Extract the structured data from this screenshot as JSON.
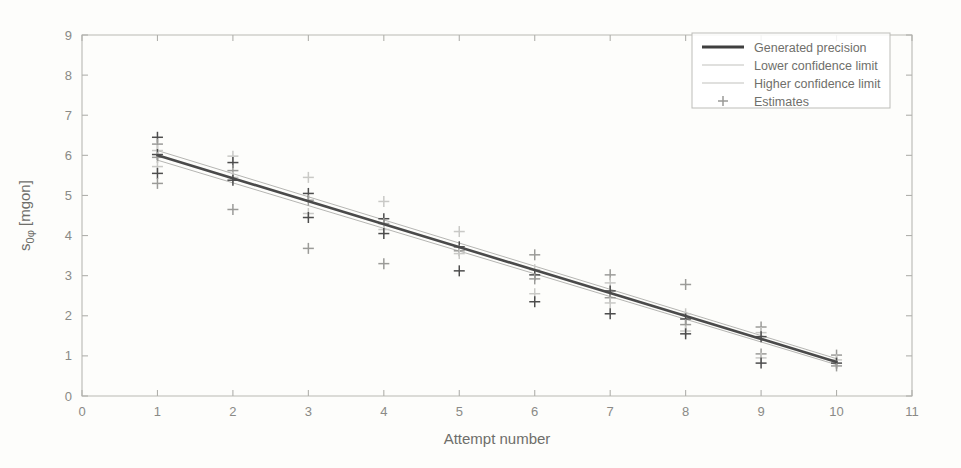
{
  "chart_data": {
    "type": "scatter",
    "title": "",
    "xlabel": "Attempt number",
    "ylabel": "s0φ [mgon]",
    "xlim": [
      0,
      11
    ],
    "ylim": [
      0,
      9
    ],
    "xticks": [
      0,
      1,
      2,
      3,
      4,
      5,
      6,
      7,
      8,
      9,
      10,
      11
    ],
    "yticks": [
      0,
      1,
      2,
      3,
      4,
      5,
      6,
      7,
      8,
      9
    ],
    "grid": false,
    "legend_position": "top-right",
    "legend": [
      {
        "label": "Generated precision",
        "style": "line",
        "color": "#3f3f3f"
      },
      {
        "label": "Lower confidence limit",
        "style": "line",
        "color": "#c6c6c3"
      },
      {
        "label": "Higher confidence limit",
        "style": "line",
        "color": "#c6c6c3"
      },
      {
        "label": "Estimates",
        "style": "plus-marker",
        "color": "#9a9a97"
      }
    ],
    "series": [
      {
        "name": "Generated precision",
        "type": "line",
        "x": [
          1,
          10
        ],
        "values": [
          6.0,
          0.85
        ]
      },
      {
        "name": "Lower confidence limit",
        "type": "line",
        "x": [
          1,
          10
        ],
        "values": [
          5.88,
          0.78
        ]
      },
      {
        "name": "Higher confidence limit",
        "type": "line",
        "x": [
          1,
          10
        ],
        "values": [
          6.12,
          0.93
        ]
      },
      {
        "name": "Estimates",
        "type": "scatter",
        "points": [
          {
            "x": 1,
            "y": 6.45
          },
          {
            "x": 1,
            "y": 6.28
          },
          {
            "x": 1,
            "y": 6.12
          },
          {
            "x": 1,
            "y": 6.02
          },
          {
            "x": 1,
            "y": 5.95
          },
          {
            "x": 1,
            "y": 5.72
          },
          {
            "x": 1,
            "y": 5.55
          },
          {
            "x": 1,
            "y": 5.3
          },
          {
            "x": 2,
            "y": 5.98
          },
          {
            "x": 2,
            "y": 5.82
          },
          {
            "x": 2,
            "y": 5.62
          },
          {
            "x": 2,
            "y": 5.45
          },
          {
            "x": 2,
            "y": 5.38
          },
          {
            "x": 2,
            "y": 4.65
          },
          {
            "x": 3,
            "y": 5.45
          },
          {
            "x": 3,
            "y": 5.05
          },
          {
            "x": 3,
            "y": 4.88
          },
          {
            "x": 3,
            "y": 4.55
          },
          {
            "x": 3,
            "y": 4.45
          },
          {
            "x": 3,
            "y": 3.68
          },
          {
            "x": 4,
            "y": 4.85
          },
          {
            "x": 4,
            "y": 4.42
          },
          {
            "x": 4,
            "y": 4.3
          },
          {
            "x": 4,
            "y": 4.15
          },
          {
            "x": 4,
            "y": 4.05
          },
          {
            "x": 4,
            "y": 3.3
          },
          {
            "x": 5,
            "y": 4.1
          },
          {
            "x": 5,
            "y": 3.72
          },
          {
            "x": 5,
            "y": 3.62
          },
          {
            "x": 5,
            "y": 3.55
          },
          {
            "x": 5,
            "y": 3.12
          },
          {
            "x": 6,
            "y": 3.52
          },
          {
            "x": 6,
            "y": 3.15
          },
          {
            "x": 6,
            "y": 3.02
          },
          {
            "x": 6,
            "y": 2.92
          },
          {
            "x": 6,
            "y": 2.55
          },
          {
            "x": 6,
            "y": 2.35
          },
          {
            "x": 7,
            "y": 3.02
          },
          {
            "x": 7,
            "y": 2.82
          },
          {
            "x": 7,
            "y": 2.62
          },
          {
            "x": 7,
            "y": 2.45
          },
          {
            "x": 7,
            "y": 2.32
          },
          {
            "x": 7,
            "y": 2.05
          },
          {
            "x": 8,
            "y": 2.78
          },
          {
            "x": 8,
            "y": 2.05
          },
          {
            "x": 8,
            "y": 1.92
          },
          {
            "x": 8,
            "y": 1.78
          },
          {
            "x": 8,
            "y": 1.62
          },
          {
            "x": 8,
            "y": 1.55
          },
          {
            "x": 9,
            "y": 1.72
          },
          {
            "x": 9,
            "y": 1.58
          },
          {
            "x": 9,
            "y": 1.48
          },
          {
            "x": 9,
            "y": 1.05
          },
          {
            "x": 9,
            "y": 0.95
          },
          {
            "x": 9,
            "y": 0.82
          },
          {
            "x": 10,
            "y": 1.02
          },
          {
            "x": 10,
            "y": 0.9
          },
          {
            "x": 10,
            "y": 0.82
          },
          {
            "x": 10,
            "y": 0.75
          }
        ]
      }
    ]
  }
}
